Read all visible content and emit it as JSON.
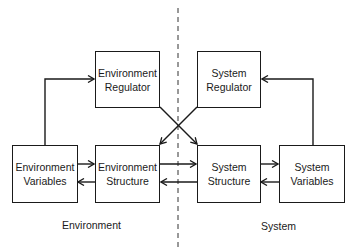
{
  "diagram": {
    "boxes": {
      "env_regulator": {
        "line1": "Environment",
        "line2": "Regulator"
      },
      "sys_regulator": {
        "line1": "System",
        "line2": "Regulator"
      },
      "env_variables": {
        "line1": "Environment",
        "line2": "Variables"
      },
      "env_structure": {
        "line1": "Environment",
        "line2": "Structure"
      },
      "sys_structure": {
        "line1": "System",
        "line2": "Structure"
      },
      "sys_variables": {
        "line1": "System",
        "line2": "Variables"
      }
    },
    "regions": {
      "left": "Environment",
      "right": "System"
    },
    "edges": [
      {
        "from": "env_variables",
        "to": "env_regulator"
      },
      {
        "from": "sys_variables",
        "to": "sys_regulator"
      },
      {
        "from": "env_regulator",
        "to": "sys_structure"
      },
      {
        "from": "sys_regulator",
        "to": "env_structure"
      },
      {
        "from": "env_variables",
        "to": "env_structure"
      },
      {
        "from": "env_structure",
        "to": "env_variables"
      },
      {
        "from": "env_structure",
        "to": "sys_structure"
      },
      {
        "from": "sys_structure",
        "to": "env_structure"
      },
      {
        "from": "sys_structure",
        "to": "sys_variables"
      },
      {
        "from": "sys_variables",
        "to": "sys_structure"
      }
    ],
    "divider": "dashed-vertical"
  }
}
